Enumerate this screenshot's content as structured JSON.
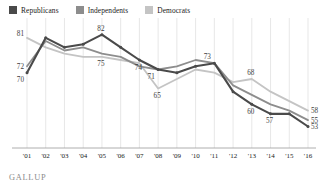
{
  "legend": {
    "items": [
      {
        "label": "Republicans",
        "color": "#4a4a4a",
        "key": "republicans"
      },
      {
        "label": "Independents",
        "color": "#8d8d8d",
        "key": "independents"
      },
      {
        "label": "Democrats",
        "color": "#c4c4c4",
        "key": "democrats"
      }
    ]
  },
  "footer": {
    "source": "GALLUP"
  },
  "chart_data": {
    "type": "line",
    "title": "",
    "xlabel": "",
    "ylabel": "",
    "grid": true,
    "legend_position": "top-left",
    "ylim": [
      50,
      86
    ],
    "categories": [
      "'01",
      "'02",
      "'03",
      "'04",
      "'05",
      "'06",
      "'07",
      "'08",
      "'09",
      "'10",
      "'11",
      "'12",
      "'13",
      "'14",
      "'15",
      "'16"
    ],
    "series": [
      {
        "name": "Republicans",
        "color": "#4a4a4a",
        "values": [
          70,
          81,
          78,
          79,
          82,
          78,
          74,
          71,
          70,
          72,
          73,
          64,
          60,
          57,
          57,
          53
        ],
        "labels": {
          "0": "70",
          "4": "82",
          "6": "74",
          "12": "60",
          "13": "57",
          "15": "53"
        }
      },
      {
        "name": "Independents",
        "color": "#8d8d8d",
        "values": [
          72,
          80,
          77,
          78,
          76,
          75,
          72,
          71,
          72,
          74,
          73,
          66,
          63,
          60,
          58,
          55
        ],
        "labels": {
          "0": "72",
          "7": "71",
          "10": "73",
          "15": "55"
        }
      },
      {
        "name": "Democrats",
        "color": "#c4c4c4",
        "values": [
          81,
          78,
          76,
          75,
          75,
          74,
          73,
          65,
          68,
          71,
          70,
          67,
          68,
          64,
          61,
          58
        ],
        "labels": {
          "0": "81",
          "4": "75",
          "7": "65",
          "12": "68",
          "15": "58"
        }
      }
    ]
  }
}
